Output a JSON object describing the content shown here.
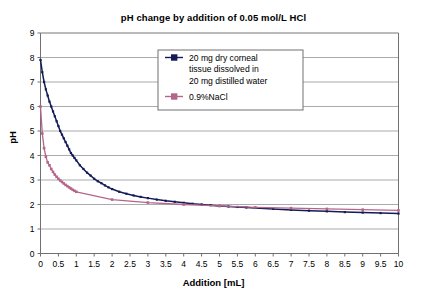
{
  "chart_data": {
    "type": "line",
    "title": "pH change by addition of 0.05 mol/L HCl",
    "xlabel": "Addition [mL]",
    "ylabel": "pH",
    "xlim": [
      0,
      10
    ],
    "ylim": [
      0,
      9
    ],
    "grid": true,
    "legend_position": "top-center-inside",
    "xticks": [
      "0",
      "0.5",
      "1",
      "1.5",
      "2",
      "2.5",
      "3",
      "3.5",
      "4",
      "4.5",
      "5",
      "5.5",
      "6",
      "6.5",
      "7",
      "7.5",
      "8",
      "8.5",
      "9",
      "9.5",
      "10"
    ],
    "xtick_values": [
      0,
      0.5,
      1,
      1.5,
      2,
      2.5,
      3,
      3.5,
      4,
      4.5,
      5,
      5.5,
      6,
      6.5,
      7,
      7.5,
      8,
      8.5,
      9,
      9.5,
      10
    ],
    "yticks": [
      "0",
      "1",
      "2",
      "3",
      "4",
      "5",
      "6",
      "7",
      "8",
      "9"
    ],
    "ytick_values": [
      0,
      1,
      2,
      3,
      4,
      5,
      6,
      7,
      8,
      9
    ],
    "series": [
      {
        "name": "20 mg dry corneal tissue dissolved in 20 mg distilled water",
        "color": "#141b55",
        "marker": "square",
        "x": [
          0,
          0.05,
          0.1,
          0.15,
          0.2,
          0.25,
          0.3,
          0.35,
          0.4,
          0.45,
          0.5,
          0.55,
          0.6,
          0.65,
          0.7,
          0.75,
          0.8,
          0.85,
          0.9,
          0.95,
          1.0,
          1.1,
          1.2,
          1.3,
          1.4,
          1.5,
          1.6,
          1.7,
          1.8,
          1.9,
          2.0,
          2.2,
          2.4,
          2.6,
          2.8,
          3.0,
          3.25,
          3.5,
          3.75,
          4.0,
          4.25,
          4.5,
          4.75,
          5.0,
          5.25,
          5.5,
          5.75,
          6.0,
          6.5,
          7.0,
          7.5,
          8.0,
          8.5,
          9.0,
          9.5,
          10.0
        ],
        "y": [
          7.9,
          7.4,
          7.0,
          6.7,
          6.45,
          6.2,
          6.0,
          5.8,
          5.6,
          5.4,
          5.2,
          5.0,
          4.85,
          4.7,
          4.55,
          4.4,
          4.25,
          4.1,
          4.0,
          3.9,
          3.8,
          3.6,
          3.45,
          3.3,
          3.18,
          3.05,
          2.95,
          2.87,
          2.78,
          2.7,
          2.63,
          2.52,
          2.44,
          2.37,
          2.31,
          2.26,
          2.2,
          2.15,
          2.11,
          2.07,
          2.03,
          2.0,
          1.97,
          1.94,
          1.92,
          1.9,
          1.88,
          1.86,
          1.82,
          1.78,
          1.75,
          1.72,
          1.69,
          1.67,
          1.65,
          1.63
        ]
      },
      {
        "name": "0.9%NaCl",
        "color": "#b4668a",
        "marker": "square",
        "x": [
          0,
          0.05,
          0.1,
          0.15,
          0.2,
          0.25,
          0.3,
          0.35,
          0.4,
          0.45,
          0.5,
          0.55,
          0.6,
          0.65,
          0.7,
          0.75,
          0.8,
          0.85,
          0.9,
          0.95,
          1.0,
          2.0,
          3.0,
          4.0,
          5.0,
          6.0,
          7.0,
          8.0,
          9.0,
          10.0
        ],
        "y": [
          6.0,
          4.9,
          4.3,
          3.95,
          3.72,
          3.6,
          3.45,
          3.33,
          3.22,
          3.13,
          3.05,
          2.98,
          2.92,
          2.86,
          2.8,
          2.75,
          2.7,
          2.65,
          2.6,
          2.56,
          2.52,
          2.2,
          2.08,
          2.0,
          1.94,
          1.88,
          1.85,
          1.82,
          1.79,
          1.76
        ]
      }
    ],
    "legend": [
      {
        "label": "20 mg dry corneal",
        "color": "#141b55"
      },
      {
        "label": "tissue dissolved in",
        "color": ""
      },
      {
        "label": "20 mg distilled water",
        "color": ""
      },
      {
        "label": "0.9%NaCl",
        "color": "#b4668a"
      }
    ],
    "colors": {
      "series1": "#141b55",
      "series2": "#b4668a",
      "grid": "#969696",
      "axis": "#808080",
      "text": "#000000",
      "background": "#ffffff"
    }
  }
}
